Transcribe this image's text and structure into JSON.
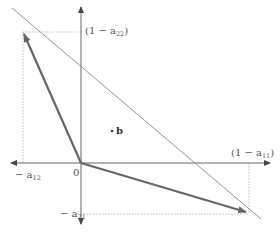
{
  "diagram": {
    "type": "vector-diagram",
    "axes": {
      "origin_label": "0",
      "x_positive_label": "(1 − a",
      "x_positive_sub": "11",
      "x_positive_close": ")",
      "y_positive_label": "(1 − a",
      "y_positive_sub": "22",
      "y_positive_close": ")",
      "x_negative_label": "− a",
      "x_negative_sub": "12",
      "y_negative_label": "− a",
      "y_negative_sub": "21"
    },
    "point": {
      "label": "b"
    },
    "vectors": [
      {
        "name": "column-1",
        "from": [
          0,
          0
        ],
        "to": [
          "-a12",
          "1-a22"
        ]
      },
      {
        "name": "column-2",
        "from": [
          0,
          0
        ],
        "to": [
          "1-a11",
          "-a21"
        ]
      }
    ],
    "colors": {
      "axis": "#555555",
      "vector": "#666666",
      "line": "#888888",
      "guide": "#aaaaaa",
      "background": "#ffffff"
    }
  }
}
